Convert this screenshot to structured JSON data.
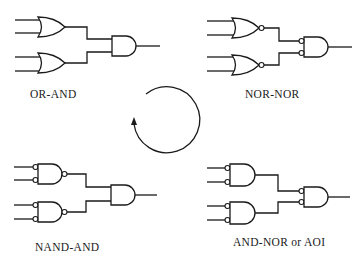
{
  "diagram": {
    "panels": [
      {
        "id": "or-and",
        "label": "OR-AND",
        "first_level": "OR",
        "second_level": "AND"
      },
      {
        "id": "nor-nor",
        "label": "NOR-NOR",
        "first_level": "NOR",
        "second_level": "AND with inverted inputs"
      },
      {
        "id": "nand-and",
        "label": "NAND-AND",
        "first_level": "NAND with inverted inputs",
        "second_level": "AND"
      },
      {
        "id": "and-nor",
        "label": "AND-NOR or AOI",
        "first_level": "AND with inverted inputs",
        "second_level": "AND with inverted inputs"
      }
    ],
    "center": {
      "symbol": "clockwise-cycle-arrow"
    },
    "colors": {
      "line": "#1a1a1a",
      "background": "#ffffff"
    }
  }
}
